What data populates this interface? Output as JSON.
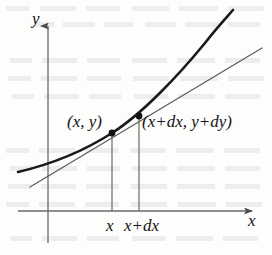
{
  "figure": {
    "kind": "calculus-differential-diagram",
    "background_color": "#fdfdfc",
    "ink_color": "#141414",
    "axis_color": "#6a6a68",
    "curve_color": "#1a1a1a",
    "tangent_color": "#5a5a58"
  },
  "axes": {
    "y_axis_label": "y",
    "x_axis_label": "x",
    "y_axis_x_px": 48,
    "x_axis_y_px": 211,
    "origin": {
      "x": 48,
      "y": 211
    },
    "y_axis_top_px": 22,
    "y_axis_bottom_px": 243,
    "x_axis_left_px": 18,
    "x_axis_right_px": 258,
    "arrowheads": [
      "y-axis-up",
      "x-axis-right"
    ]
  },
  "ticks": {
    "x": [
      {
        "label": "x",
        "x_px": 112
      },
      {
        "label": "x+dx",
        "x_px": 139
      }
    ]
  },
  "points": [
    {
      "name": "point-x-y",
      "label": "(x, y)",
      "x_px": 112,
      "y_px": 133,
      "label_x_px": 67,
      "label_y_px": 113
    },
    {
      "name": "point-x-plus-dx",
      "label": "(x+dx, y+dy)",
      "x_px": 139,
      "y_px": 116,
      "label_x_px": 142,
      "label_y_px": 113
    }
  ],
  "curve": {
    "name": "function-curve",
    "stroke_width": 2.6,
    "path": "M 18,172 C 52,164 84,151 112,133 C 142,114 178,76 205,43 C 215,30 226,18 233,10"
  },
  "tangent": {
    "name": "tangent-line",
    "stroke_width": 1.2,
    "x1": 30,
    "y1": 187,
    "x2": 262,
    "y2": 48
  },
  "drop_lines": [
    {
      "name": "drop-line-x",
      "x_px": 112,
      "y_top_px": 133,
      "y_bottom_px": 211
    },
    {
      "name": "drop-line-x-plus-dx",
      "x_px": 139,
      "y_top_px": 116,
      "y_bottom_px": 211
    }
  ]
}
